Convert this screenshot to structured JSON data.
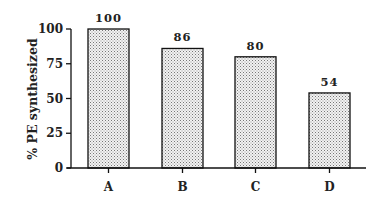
{
  "chart_data": {
    "type": "bar",
    "title": "",
    "xlabel": "",
    "ylabel": "% PE synthesized",
    "categories": [
      "A",
      "B",
      "C",
      "D"
    ],
    "values": [
      100,
      86,
      80,
      54
    ],
    "data_labels": [
      "100",
      "86",
      "80",
      "54"
    ],
    "ylim": [
      0,
      100
    ],
    "yticks": [
      0,
      25,
      50,
      75,
      100
    ],
    "ytick_labels": [
      "0",
      "25",
      "50",
      "75",
      "100"
    ],
    "grid": false,
    "legend": null,
    "bar_fill": "stippled light gray",
    "colors": {
      "bar_fill": "#d9d9d9",
      "bar_stroke": "#111111",
      "axis": "#111111"
    }
  }
}
